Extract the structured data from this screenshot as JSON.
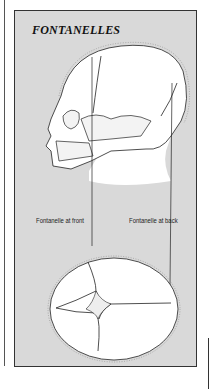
{
  "figure": {
    "title": "FONTANELLES",
    "labels": {
      "front": "Fontanelle at front",
      "back": "Fontanelle at back"
    },
    "views": [
      "side-view-infant-skull",
      "top-view-infant-skull"
    ]
  },
  "colors": {
    "panel_bg": "#d9d9d9",
    "skull_fill": "#ffffff",
    "outline": "#222222",
    "border": "#333333"
  }
}
